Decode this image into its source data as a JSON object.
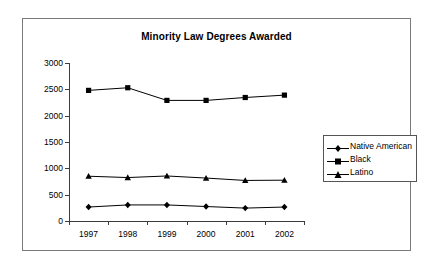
{
  "chart_data": {
    "type": "line",
    "title": "Minority Law Degrees Awarded",
    "xlabel": "",
    "ylabel": "",
    "categories": [
      "1997",
      "1998",
      "1999",
      "2000",
      "2001",
      "2002"
    ],
    "series": [
      {
        "name": "Native American",
        "marker": "diamond",
        "values": [
          265,
          305,
          305,
          275,
          245,
          265
        ]
      },
      {
        "name": "Black",
        "marker": "square",
        "values": [
          2480,
          2530,
          2290,
          2290,
          2345,
          2390
        ]
      },
      {
        "name": "Latino",
        "marker": "triangle",
        "values": [
          850,
          825,
          855,
          815,
          770,
          775
        ]
      }
    ],
    "ylim": [
      0,
      3000
    ],
    "yticks": [
      "0",
      "500",
      "1000",
      "1500",
      "2000",
      "2500",
      "3000"
    ],
    "grid": false,
    "legend_position": "right",
    "colors": {
      "series": "#000000",
      "axis": "#3c3c3c",
      "frame": "#7a7a7a",
      "background": "#ffffff"
    }
  }
}
